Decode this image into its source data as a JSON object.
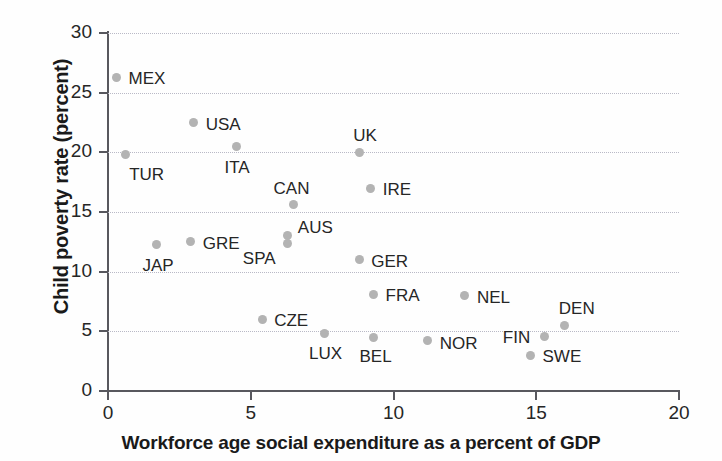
{
  "chart_data": {
    "type": "scatter",
    "title": "",
    "xlabel": "Workforce age social expenditure as a percent of GDP",
    "ylabel": "Child poverty rate (percent)",
    "xlim": [
      0,
      20
    ],
    "ylim": [
      0,
      30
    ],
    "xticks": [
      "0",
      "5",
      "10",
      "15",
      "20"
    ],
    "xtick_values": [
      0,
      5,
      10,
      15,
      20
    ],
    "yticks": [
      "0",
      "5",
      "10",
      "15",
      "20",
      "25",
      "30"
    ],
    "ytick_values": [
      0,
      5,
      10,
      15,
      20,
      25,
      30
    ],
    "grid": "horizontal-dotted",
    "legend": "none",
    "point_color": "#b3b3b3",
    "axis_color": "#58585e",
    "grid_color": "#b9b9c6",
    "points": [
      {
        "label": "MEX",
        "x": 0.3,
        "y": 26.3,
        "lx": 12,
        "ly": -8
      },
      {
        "label": "TUR",
        "x": 0.6,
        "y": 19.8,
        "lx": 4,
        "ly": 10
      },
      {
        "label": "JAP",
        "x": 1.7,
        "y": 12.3,
        "lx": -14,
        "ly": 12
      },
      {
        "label": "GRE",
        "x": 2.9,
        "y": 12.5,
        "lx": 12,
        "ly": -8
      },
      {
        "label": "USA",
        "x": 3.0,
        "y": 22.5,
        "lx": 12,
        "ly": -8
      },
      {
        "label": "ITA",
        "x": 4.5,
        "y": 20.5,
        "lx": -12,
        "ly": 12
      },
      {
        "label": "CZE",
        "x": 5.4,
        "y": 6.0,
        "lx": 12,
        "ly": -8
      },
      {
        "label": "SPA",
        "x": 6.3,
        "y": 12.4,
        "lx": -45,
        "ly": 6
      },
      {
        "label": "AUS",
        "x": 6.3,
        "y": 13.0,
        "lx": 10,
        "ly": -18
      },
      {
        "label": "CAN",
        "x": 6.5,
        "y": 15.6,
        "lx": -20,
        "ly": -26
      },
      {
        "label": "LUX",
        "x": 7.6,
        "y": 4.8,
        "lx": -16,
        "ly": 10
      },
      {
        "label": "UK",
        "x": 8.8,
        "y": 20.0,
        "lx": -6,
        "ly": -26
      },
      {
        "label": "GER",
        "x": 8.8,
        "y": 11.0,
        "lx": 12,
        "ly": -8
      },
      {
        "label": "IRE",
        "x": 9.2,
        "y": 17.0,
        "lx": 12,
        "ly": -8
      },
      {
        "label": "FRA",
        "x": 9.3,
        "y": 8.1,
        "lx": 12,
        "ly": -8
      },
      {
        "label": "BEL",
        "x": 9.3,
        "y": 4.5,
        "lx": -14,
        "ly": 10
      },
      {
        "label": "NOR",
        "x": 11.2,
        "y": 4.2,
        "lx": 12,
        "ly": -7
      },
      {
        "label": "NEL",
        "x": 12.5,
        "y": 8.0,
        "lx": 12,
        "ly": -8
      },
      {
        "label": "SWE",
        "x": 14.8,
        "y": 3.0,
        "lx": 12,
        "ly": -8
      },
      {
        "label": "FIN",
        "x": 15.3,
        "y": 4.6,
        "lx": -42,
        "ly": -8
      },
      {
        "label": "DEN",
        "x": 16.0,
        "y": 5.5,
        "lx": -6,
        "ly": -26
      }
    ]
  }
}
